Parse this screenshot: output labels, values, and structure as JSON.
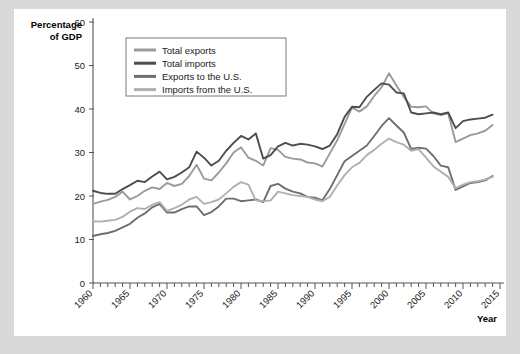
{
  "chart_data": {
    "type": "line",
    "title": "",
    "xlabel": "Year",
    "ylabel": "Percentage of GDP",
    "ylabel_line1": "Percentage",
    "ylabel_line2": "of GDP",
    "xlim": [
      1960,
      2015
    ],
    "ylim": [
      0,
      60
    ],
    "ytick_step": 10,
    "xtick_major_step": 5,
    "xtick_minor_step": 1,
    "grid": false,
    "legend_position": "top-left inside plot",
    "yticks": [
      0,
      10,
      20,
      30,
      40,
      50,
      60
    ],
    "xticks": [
      1960,
      1965,
      1970,
      1975,
      1980,
      1985,
      1990,
      1995,
      2000,
      2005,
      2010,
      2015
    ],
    "x": [
      1960,
      1961,
      1962,
      1963,
      1964,
      1965,
      1966,
      1967,
      1968,
      1969,
      1970,
      1971,
      1972,
      1973,
      1974,
      1975,
      1976,
      1977,
      1978,
      1979,
      1980,
      1981,
      1982,
      1983,
      1984,
      1985,
      1986,
      1987,
      1988,
      1989,
      1990,
      1991,
      1992,
      1993,
      1994,
      1995,
      1996,
      1997,
      1998,
      1999,
      2000,
      2001,
      2002,
      2003,
      2004,
      2005,
      2006,
      2007,
      2008,
      2009,
      2010,
      2011,
      2012,
      2013,
      2014
    ],
    "series": [
      {
        "name": "Total exports",
        "color": "#9a9a9a",
        "values": [
          18.2,
          18.7,
          19.1,
          19.8,
          21.0,
          19.2,
          20.0,
          21.2,
          22.0,
          21.6,
          23.0,
          22.3,
          22.8,
          24.6,
          27.2,
          24.0,
          23.6,
          25.4,
          27.5,
          30.0,
          31.2,
          28.8,
          28.1,
          27.0,
          31.0,
          30.6,
          29.0,
          28.6,
          28.4,
          27.7,
          27.5,
          26.8,
          29.8,
          32.8,
          36.6,
          40.3,
          39.4,
          40.6,
          43.0,
          45.0,
          48.2,
          45.4,
          42.8,
          40.5,
          40.4,
          40.6,
          39.0,
          38.6,
          39.0,
          32.4,
          33.2,
          34.0,
          34.4,
          35.0,
          36.3
        ]
      },
      {
        "name": "Total imports",
        "color": "#4d4d4d",
        "values": [
          21.2,
          20.7,
          20.5,
          20.5,
          21.6,
          22.5,
          23.5,
          23.2,
          24.5,
          25.6,
          23.8,
          24.4,
          25.4,
          26.6,
          30.2,
          28.8,
          27.0,
          28.1,
          30.4,
          32.2,
          33.8,
          33.0,
          34.4,
          28.6,
          29.4,
          31.4,
          32.2,
          31.6,
          32.0,
          31.8,
          31.4,
          30.8,
          31.6,
          34.2,
          38.2,
          40.5,
          40.4,
          42.8,
          44.4,
          45.9,
          45.6,
          43.8,
          43.6,
          39.2,
          38.8,
          39.0,
          39.2,
          38.8,
          39.2,
          35.6,
          37.2,
          37.6,
          37.8,
          38.0,
          38.7
        ]
      },
      {
        "name": "Exports to the U.S.",
        "color": "#6e6e6e",
        "values": [
          10.8,
          11.2,
          11.5,
          12.0,
          12.8,
          13.6,
          15.0,
          16.0,
          17.4,
          18.2,
          16.2,
          16.2,
          17.0,
          17.6,
          17.6,
          15.6,
          16.3,
          17.6,
          19.4,
          19.4,
          18.8,
          19.0,
          19.2,
          18.6,
          22.3,
          22.8,
          21.7,
          21.0,
          20.6,
          19.8,
          19.6,
          19.0,
          21.6,
          24.8,
          28.0,
          29.2,
          30.4,
          31.6,
          33.8,
          36.1,
          37.9,
          36.2,
          34.6,
          30.8,
          31.1,
          30.9,
          29.2,
          27.0,
          26.6,
          21.4,
          22.2,
          23.0,
          23.2,
          23.6,
          24.6
        ]
      },
      {
        "name": "Imports from the U.S.",
        "color": "#b0b0b0",
        "values": [
          14.2,
          14.1,
          14.3,
          14.5,
          15.2,
          16.4,
          17.2,
          17.0,
          18.0,
          18.6,
          16.6,
          17.2,
          18.0,
          19.2,
          19.8,
          18.2,
          18.6,
          19.2,
          20.6,
          22.1,
          23.2,
          22.6,
          19.0,
          18.8,
          19.0,
          21.0,
          20.6,
          20.2,
          20.0,
          19.8,
          19.2,
          18.8,
          19.8,
          22.4,
          24.8,
          26.6,
          27.6,
          29.4,
          30.6,
          32.0,
          33.2,
          32.4,
          31.8,
          30.4,
          30.8,
          28.8,
          26.8,
          25.6,
          24.4,
          21.8,
          22.6,
          23.2,
          23.4,
          23.8,
          24.4
        ]
      }
    ],
    "legend_entries": [
      {
        "label": "Total exports",
        "color": "#9a9a9a"
      },
      {
        "label": "Total imports",
        "color": "#4d4d4d"
      },
      {
        "label": "Exports to the U.S.",
        "color": "#6e6e6e"
      },
      {
        "label": "Imports from the U.S.",
        "color": "#b0b0b0"
      }
    ]
  },
  "page": {
    "background": "#d9d9d9",
    "sheet_background": "#ffffff"
  }
}
